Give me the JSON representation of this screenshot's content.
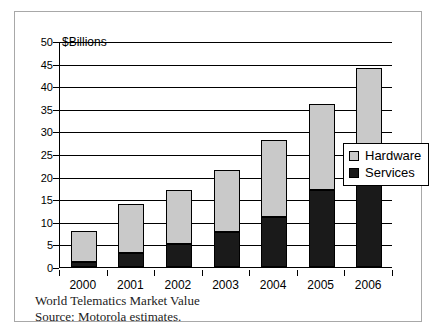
{
  "chart_data": {
    "type": "bar",
    "subtype": "stacked-column",
    "title": "",
    "axis_note": "$Billions",
    "xlabel": "",
    "ylabel": "",
    "categories": [
      "2000",
      "2001",
      "2002",
      "2003",
      "2004",
      "2005",
      "2006"
    ],
    "series": [
      {
        "name": "Services",
        "color": "#1a1a1a",
        "values": [
          1,
          3,
          5,
          7.8,
          11,
          17,
          21.5
        ]
      },
      {
        "name": "Hardware",
        "color": "#c9c9c9",
        "values": [
          7,
          11,
          12,
          13.7,
          17,
          19,
          22.5
        ]
      }
    ],
    "totals": [
      8,
      14,
      17,
      21.5,
      28,
      36,
      44
    ],
    "ylim": [
      0,
      50
    ],
    "yticks": [
      0,
      5,
      10,
      15,
      20,
      25,
      30,
      35,
      40,
      45,
      50
    ],
    "grid": true,
    "legend_position": "right"
  },
  "legend": {
    "items": [
      {
        "label": "Hardware",
        "swatch": "hardware-swatch"
      },
      {
        "label": "Services",
        "swatch": "services-swatch"
      }
    ]
  },
  "caption": {
    "line1": "World Telematics Market Value",
    "line2": "Source: Motorola estimates."
  }
}
